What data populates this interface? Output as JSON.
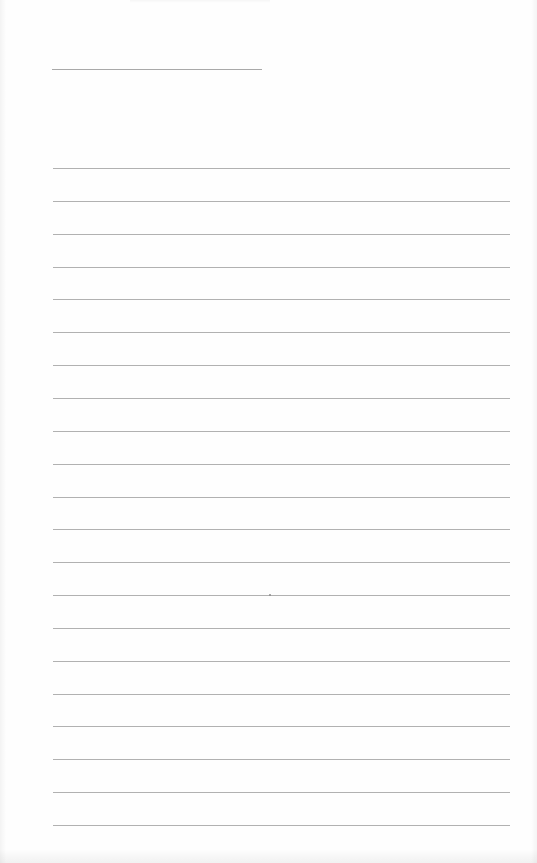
{
  "document": {
    "type": "lined-writing-page",
    "background": "#fefefe",
    "line_color": "#a3a3a3",
    "title_line": {
      "x": 52,
      "y": 69,
      "width": 210
    },
    "rules": {
      "x": 53,
      "width": 457,
      "first_y": 168,
      "spacing": 32.85,
      "count": 21
    },
    "specks": [
      {
        "x": 269,
        "y": 594
      }
    ]
  }
}
